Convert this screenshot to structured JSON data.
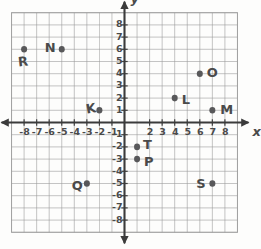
{
  "figure": {
    "kind": "coordinate-plane-worksheet",
    "paper_color": "#fdfdfc",
    "grid_color": "#9a9a9a",
    "axis_color": "#3b3b3b",
    "ink_color": "#4a4a4a",
    "point_color": "#58585a"
  },
  "axes": {
    "x_label": "x",
    "y_label": "y",
    "x_min": -9,
    "x_max": 9,
    "y_min": -9,
    "y_max": 9,
    "grid_left": -9,
    "grid_right": 9,
    "grid_bottom": -9,
    "grid_top": 9,
    "x_tick_labels": [
      "-8",
      "-7",
      "-6",
      "-5",
      "-4",
      "-3",
      "-2",
      "-1",
      "2",
      "3",
      "4",
      "5",
      "6",
      "7",
      "8"
    ],
    "x_tick_values": [
      -8,
      -7,
      -6,
      -5,
      -4,
      -3,
      -2,
      -1,
      2,
      3,
      4,
      5,
      6,
      7,
      8
    ],
    "y_tick_labels": [
      "8",
      "7",
      "6",
      "5",
      "4",
      "3",
      "2",
      "1",
      "-1",
      "-2",
      "-3",
      "-4",
      "-5",
      "-6",
      "-7",
      "-8"
    ],
    "y_tick_values": [
      8,
      7,
      6,
      5,
      4,
      3,
      2,
      1,
      -1,
      -2,
      -3,
      -4,
      -5,
      -6,
      -7,
      -8
    ]
  },
  "chart_data": {
    "type": "scatter",
    "title": "",
    "xlabel": "x",
    "ylabel": "y",
    "xlim": [
      -9,
      9
    ],
    "ylim": [
      -9,
      9
    ],
    "grid": true,
    "legend": "none",
    "points": [
      {
        "label": "R",
        "x": -8,
        "y": 6,
        "label_dx": -6,
        "label_dy": 13,
        "label_rot": -6
      },
      {
        "label": "N",
        "x": -5,
        "y": 6,
        "label_dx": -17,
        "label_dy": -1,
        "label_rot": 0
      },
      {
        "label": "K",
        "x": -2,
        "y": 1,
        "label_dx": -13,
        "label_dy": -1,
        "label_rot": -10
      },
      {
        "label": "O",
        "x": 6,
        "y": 4,
        "label_dx": 7,
        "label_dy": -1,
        "label_rot": 0
      },
      {
        "label": "L",
        "x": 4,
        "y": 2,
        "label_dx": 7,
        "label_dy": 2,
        "label_rot": 0
      },
      {
        "label": "M",
        "x": 7,
        "y": 1,
        "label_dx": 8,
        "label_dy": 0,
        "label_rot": 0
      },
      {
        "label": "T",
        "x": 1,
        "y": -2,
        "label_dx": 6,
        "label_dy": -2,
        "label_rot": 0
      },
      {
        "label": "P",
        "x": 1,
        "y": -3,
        "label_dx": 7,
        "label_dy": 3,
        "label_rot": 0
      },
      {
        "label": "Q",
        "x": -3,
        "y": -5,
        "label_dx": -15,
        "label_dy": 2,
        "label_rot": 0
      },
      {
        "label": "S",
        "x": 7,
        "y": -5,
        "label_dx": -16,
        "label_dy": 0,
        "label_rot": 0
      }
    ]
  }
}
